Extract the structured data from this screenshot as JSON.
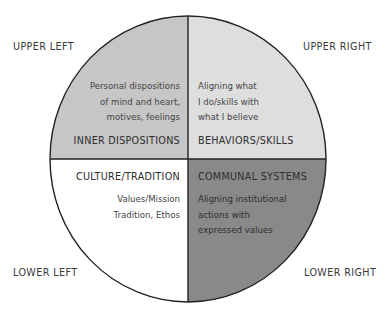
{
  "diagram": {
    "type": "quadrant-circle",
    "center": {
      "x": 188,
      "y": 159
    },
    "radius": {
      "x": 138,
      "y": 143
    },
    "colors": {
      "upper_left": "#c6c6c6",
      "upper_right": "#dedede",
      "lower_left": "#ffffff",
      "lower_right": "#898989",
      "stroke": "#222222"
    }
  },
  "corner_labels": {
    "upper_left": "UPPER LEFT",
    "upper_right": "UPPER RIGHT",
    "lower_left": "LOWER LEFT",
    "lower_right": "LOWER RIGHT"
  },
  "quadrants": {
    "upper_left": {
      "title": "INNER DISPOSITIONS",
      "lines": [
        "Personal dispositions",
        "of mind and heart,",
        "motives, feelings"
      ]
    },
    "upper_right": {
      "title": "BEHAVIORS/SKILLS",
      "lines": [
        "Aligning what",
        "I do/skills with",
        "what I believe"
      ]
    },
    "lower_left": {
      "title": "CULTURE/TRADITION",
      "lines": [
        "Values/Mission",
        "Tradition, Ethos"
      ]
    },
    "lower_right": {
      "title": "COMMUNAL SYSTEMS",
      "lines": [
        "Aligning institutional",
        "actions with",
        "expressed values"
      ]
    }
  }
}
